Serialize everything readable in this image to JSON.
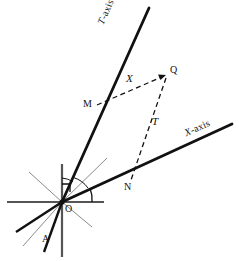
{
  "figure": {
    "kind": "oblique-coordinate-geometry-diagram",
    "width": 239,
    "height": 261,
    "background_color": "#ffffff",
    "stroke_color": "#111111",
    "thin_stroke_color": "#8a8a8a"
  },
  "axes": [
    {
      "id": "t-axis",
      "label": "T-axis",
      "label_prefix": "T",
      "label_suffix": "-axis",
      "from": {
        "x": 62,
        "y": 202
      },
      "to": {
        "x": 149,
        "y": 8
      },
      "label_pos": {
        "x": 101,
        "y": 25
      },
      "label_rotation_deg": -66,
      "thickness": 2.6
    },
    {
      "id": "x-axis",
      "label": "X-axis",
      "label_prefix": "X",
      "label_suffix": "-axis",
      "from": {
        "x": 62,
        "y": 202
      },
      "to": {
        "x": 232,
        "y": 124
      },
      "label_pos": {
        "x": 186,
        "y": 122
      },
      "label_rotation_deg": -24,
      "thickness": 2.6
    }
  ],
  "points": [
    {
      "id": "O",
      "label": "O",
      "x": 62,
      "y": 202,
      "label_pos": {
        "x": 65,
        "y": 206
      }
    },
    {
      "id": "A",
      "label": "A",
      "x": 47,
      "y": 243,
      "label_pos": {
        "x": 44,
        "y": 238
      }
    },
    {
      "id": "M",
      "label": "M",
      "x": 97,
      "y": 105,
      "label_pos": {
        "x": 84,
        "y": 100
      }
    },
    {
      "id": "N",
      "label": "N",
      "x": 131,
      "y": 181,
      "label_pos": {
        "x": 125,
        "y": 183
      }
    },
    {
      "id": "Q",
      "label": "Q",
      "x": 167,
      "y": 74,
      "label_pos": {
        "x": 171,
        "y": 68
      }
    }
  ],
  "segments": [
    {
      "id": "mq",
      "label": "X",
      "style": "dashed",
      "from": {
        "x": 97,
        "y": 105
      },
      "to": {
        "x": 166,
        "y": 75
      },
      "label_pos": {
        "x": 128,
        "y": 79
      }
    },
    {
      "id": "qn",
      "label": "T",
      "style": "dashed",
      "from": {
        "x": 166,
        "y": 76
      },
      "to": {
        "x": 131,
        "y": 180
      },
      "label_pos": {
        "x": 154,
        "y": 122
      }
    }
  ],
  "construction_lines": [
    {
      "id": "vertical-line",
      "weight": "medium",
      "from": {
        "x": 62,
        "y": 165
      },
      "to": {
        "x": 62,
        "y": 257
      }
    },
    {
      "id": "horizontal-line",
      "weight": "medium",
      "from": {
        "x": 7,
        "y": 202
      },
      "to": {
        "x": 104,
        "y": 202
      }
    },
    {
      "id": "oa-line",
      "weight": "thick",
      "from": {
        "x": 62,
        "y": 202
      },
      "to": {
        "x": 44,
        "y": 252
      }
    },
    {
      "id": "lower-left-ray-1",
      "weight": "thick",
      "from": {
        "x": 62,
        "y": 202
      },
      "to": {
        "x": 16,
        "y": 232
      }
    },
    {
      "id": "lower-left-ray-2",
      "weight": "thin",
      "from": {
        "x": 62,
        "y": 202
      },
      "to": {
        "x": 23,
        "y": 246
      }
    },
    {
      "id": "upper-left-ray",
      "weight": "thin",
      "from": {
        "x": 62,
        "y": 202
      },
      "to": {
        "x": 29,
        "y": 172
      }
    },
    {
      "id": "upper-right-ray",
      "weight": "thin",
      "from": {
        "x": 62,
        "y": 202
      },
      "to": {
        "x": 107,
        "y": 158
      }
    },
    {
      "id": "lower-right-ray",
      "weight": "thin",
      "from": {
        "x": 62,
        "y": 202
      },
      "to": {
        "x": 92,
        "y": 227
      }
    }
  ],
  "angle_markers": [
    {
      "id": "right-angle-square",
      "type": "right-angle",
      "at": {
        "x": 62,
        "y": 202
      }
    },
    {
      "id": "angle-arc-t-axis",
      "type": "arc",
      "at": {
        "x": 62,
        "y": 202
      }
    },
    {
      "id": "angle-arc-x-axis",
      "type": "arc",
      "at": {
        "x": 62,
        "y": 202
      }
    }
  ]
}
